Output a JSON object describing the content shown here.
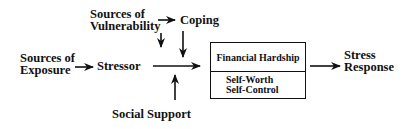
{
  "diagram": {
    "nodes": {
      "sources_of_exposure": {
        "line1": "Sources of",
        "line2": "Exposure"
      },
      "stressor": {
        "label": "Stressor"
      },
      "sources_of_vulnerability": {
        "line1": "Sources of",
        "line2": "Vulnerability"
      },
      "coping": {
        "label": "Coping"
      },
      "social_support": {
        "label": "Social Support"
      },
      "outcome_box": {
        "top": "Financial Hardship",
        "bottom_line1": "Self-Worth",
        "bottom_line2": "Self-Control"
      },
      "stress_response": {
        "line1": "Stress",
        "line2": "Response"
      }
    },
    "edges": [
      {
        "from": "Sources of Exposure",
        "to": "Stressor"
      },
      {
        "from": "Sources of Vulnerability",
        "to": "Coping"
      },
      {
        "from": "Sources of Vulnerability",
        "to": "Stressor-Outcome path"
      },
      {
        "from": "Coping",
        "to": "Stressor-Outcome path"
      },
      {
        "from": "Social Support",
        "to": "Stressor-Outcome path"
      },
      {
        "from": "Stressor",
        "to": "Financial Hardship / Self-Worth / Self-Control"
      },
      {
        "from": "Financial Hardship / Self-Worth / Self-Control",
        "to": "Stress Response"
      }
    ],
    "colors": {
      "ink": "#111111",
      "background": "#ffffff"
    }
  }
}
